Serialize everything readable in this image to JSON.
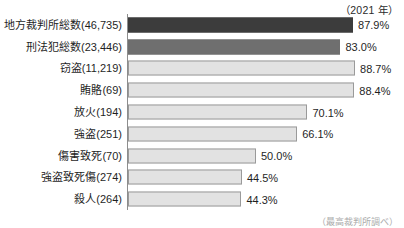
{
  "header": {
    "year_caption": "（2021 年）"
  },
  "footer": {
    "source_note": "（最高裁判所調べ）"
  },
  "chart_data": {
    "type": "bar",
    "orientation": "horizontal",
    "title": "",
    "subtitle": "",
    "xlabel": "",
    "ylabel": "",
    "xlim": [
      0,
      100
    ],
    "grid": false,
    "legend": null,
    "axis_line_color": "#8d8d8d",
    "categories": [
      "地方裁判所総数(46,735)",
      "刑法犯総数(23,446)",
      "窃盗(11,219)",
      "賄賂(69)",
      "放火(194)",
      "強盗(251)",
      "傷害致死(70)",
      "強盗致死傷(274)",
      "殺人(264)"
    ],
    "values": [
      87.9,
      83.0,
      88.7,
      88.4,
      70.1,
      66.1,
      50.0,
      44.5,
      44.3
    ],
    "value_labels": [
      "87.9%",
      "83.0%",
      "88.7%",
      "88.4%",
      "70.1%",
      "66.1%",
      "50.0%",
      "44.5%",
      "44.3%"
    ],
    "bar_tones": [
      "dark",
      "mid",
      "light",
      "light",
      "light",
      "light",
      "light",
      "light",
      "light"
    ],
    "colors": {
      "dark": "#3c3c3c",
      "mid": "#6f6f6f",
      "light": "#e2e2e2",
      "light_border": "#9a9a9a"
    }
  }
}
